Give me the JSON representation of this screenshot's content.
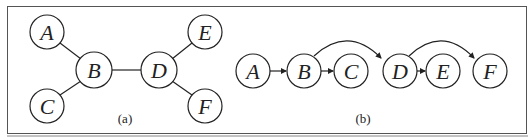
{
  "panels": [
    {
      "id": "a",
      "caption": "(a)",
      "nodes": [
        {
          "label": "A",
          "x": 47,
          "y": 32
        },
        {
          "label": "B",
          "x": 94,
          "y": 70
        },
        {
          "label": "C",
          "x": 47,
          "y": 106
        },
        {
          "label": "D",
          "x": 159,
          "y": 70
        },
        {
          "label": "E",
          "x": 205,
          "y": 32
        },
        {
          "label": "F",
          "x": 205,
          "y": 106
        }
      ],
      "edges": [
        [
          "A",
          "B"
        ],
        [
          "C",
          "B"
        ],
        [
          "B",
          "D"
        ],
        [
          "D",
          "E"
        ],
        [
          "D",
          "F"
        ]
      ],
      "directed": false
    },
    {
      "id": "b",
      "caption": "(b)",
      "nodes": [
        {
          "label": "A",
          "x": 253,
          "y": 71
        },
        {
          "label": "B",
          "x": 304,
          "y": 71
        },
        {
          "label": "C",
          "x": 351,
          "y": 71
        },
        {
          "label": "D",
          "x": 400,
          "y": 71
        },
        {
          "label": "E",
          "x": 443,
          "y": 71
        },
        {
          "label": "F",
          "x": 490,
          "y": 71
        }
      ],
      "edges": [
        [
          "A",
          "B"
        ],
        [
          "B",
          "C"
        ],
        [
          "B",
          "D"
        ],
        [
          "D",
          "E"
        ],
        [
          "D",
          "F"
        ]
      ],
      "directed": true
    }
  ],
  "style": {
    "stroke": "#222222",
    "border": "#555555",
    "background": "#ffffff"
  }
}
